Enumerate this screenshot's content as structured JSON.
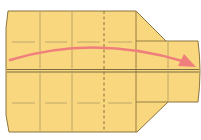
{
  "diagram": {
    "type": "origami-fold-step",
    "colors": {
      "paper": "#f9d77e",
      "paper_dark": "#f3cb6a",
      "edge": "#8a7440",
      "crease": "#b4a068",
      "arrow": "#ef7f7c",
      "background": "#ffffff"
    },
    "elements": {
      "paper_shape": "paper-outline",
      "center_line": "horizontal-center-fold",
      "valley_fold": "dashed-vertical-fold",
      "arrow": "fold-direction-arrow"
    }
  }
}
